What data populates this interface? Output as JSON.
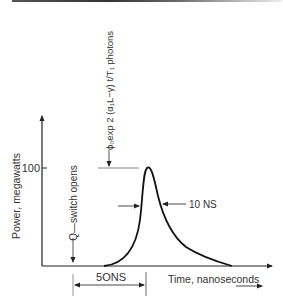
{
  "figure": {
    "y_axis_label": "Power, megawatts",
    "x_axis_label": "Time, nanoseconds",
    "y_tick_label": "100",
    "q_switch_label": "Q—switch opens",
    "photon_annotation": "ϕ₀exp 2 (α₁L−γ) t/T₁ photons",
    "pulse_width_label": "10 NS",
    "delay_label": "5ONS"
  },
  "colors": {
    "line": "#1a1a1a",
    "text": "#333333",
    "guide": "#777777"
  }
}
